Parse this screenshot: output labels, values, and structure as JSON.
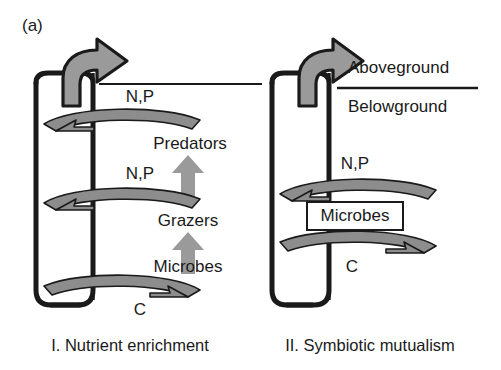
{
  "figure": {
    "panel_letter": "(a)",
    "background": "#ffffff",
    "ink": "#1a1a1a",
    "fill_gray": "#9a9a9a",
    "fill_gray_dark": "#8a8a8a"
  },
  "strata": {
    "above_label": "Aboveground",
    "below_label": "Belowground"
  },
  "panels": [
    {
      "id": "nutrient-enrichment",
      "caption": "I. Nutrient enrichment",
      "export_arrow": "export-arrow",
      "loops": [
        {
          "id": "upper",
          "nutrient_label": "N,P",
          "direction": "left"
        },
        {
          "id": "middle",
          "nutrient_label": "N,P",
          "direction": "left"
        },
        {
          "id": "lower",
          "nutrient_label": "C",
          "direction": "right"
        }
      ],
      "trophic_levels": [
        {
          "label": "Predators"
        },
        {
          "label": "Grazers"
        },
        {
          "label": "Microbes"
        }
      ],
      "trophic_arrows": [
        {
          "id": "microbes-to-grazers"
        },
        {
          "id": "grazers-to-predators"
        }
      ]
    },
    {
      "id": "symbiotic-mutualism",
      "caption": "II. Symbiotic mutualism",
      "export_arrow": "export-arrow",
      "loops": [
        {
          "id": "upper",
          "nutrient_label": "N,P",
          "direction": "left"
        },
        {
          "id": "lower",
          "nutrient_label": "C",
          "direction": "right"
        }
      ],
      "boxed_node": {
        "label": "Microbes"
      }
    }
  ]
}
